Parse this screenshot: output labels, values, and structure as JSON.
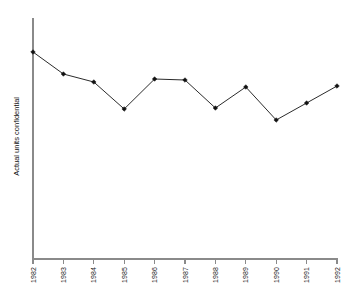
{
  "chart_data": {
    "type": "line",
    "title": "",
    "subtitle": "",
    "xlabel": "",
    "ylabel": "Actual units confidential",
    "categories": [
      "1982",
      "1983",
      "1984",
      "1985",
      "1986",
      "1987",
      "1988",
      "1989",
      "1990",
      "1991",
      "1992"
    ],
    "x": [
      1982,
      1983,
      1984,
      1985,
      1986,
      1987,
      1988,
      1989,
      1990,
      1991,
      1992
    ],
    "values": [
      100,
      78,
      70,
      43,
      73,
      72,
      44,
      65,
      32,
      49,
      66
    ],
    "series": [
      {
        "name": "Actual units confidential",
        "values": [
          100,
          78,
          70,
          43,
          73,
          72,
          44,
          65,
          32,
          49,
          66
        ]
      }
    ],
    "ylim": [
      0,
      110
    ],
    "xlim": [
      1982,
      1992
    ],
    "grid": false,
    "legend": false,
    "legend_position": "none",
    "y_axis_ticks_shown": false,
    "marker": "filled-diamond",
    "line_color": "#2b2b2b",
    "marker_color": "#111111",
    "axis_color": "#8a8a8a",
    "background_color": "#ffffff",
    "annotations": []
  },
  "axes": {
    "y_axis_label": "Actual units confidential",
    "x_tick_labels": [
      "1982",
      "1983",
      "1984",
      "1985",
      "1986",
      "1987",
      "1988",
      "1989",
      "1990",
      "1991",
      "1992"
    ]
  }
}
